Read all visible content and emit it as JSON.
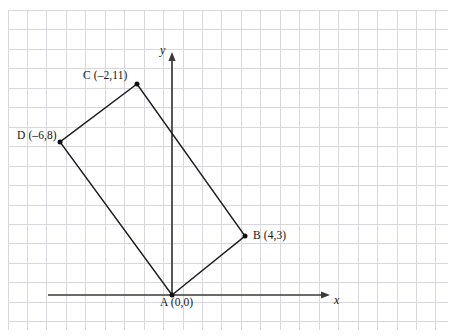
{
  "figure": {
    "kind": "coordinate-grid-diagram",
    "width": 452,
    "height": 336,
    "background_color": "#ffffff",
    "grid": {
      "minor_color": "#d8d8dc",
      "major_color": "#8f8f96",
      "spacing_px": 19.45,
      "origin_px": {
        "x": 172,
        "y": 295
      },
      "first_line_px": {
        "x": 8.0,
        "y": 10.5
      },
      "columns": 23,
      "rows": 17,
      "major_every": 0
    },
    "axes": {
      "color": "#3a3a3a",
      "x_axis": {
        "label": "x",
        "from_px": {
          "x": 48,
          "y": 295
        },
        "to_px": {
          "x": 330,
          "y": 295
        },
        "arrow": "right"
      },
      "y_axis": {
        "label": "y",
        "from_px": {
          "x": 172,
          "y": 295
        },
        "to_px": {
          "x": 172,
          "y": 52
        },
        "arrow": "up"
      }
    }
  },
  "chart_data": {
    "type": "scatter",
    "title": "",
    "xlabel": "x",
    "ylabel": "y",
    "grid": true,
    "legend": "none",
    "units_per_cell": 1,
    "shape": {
      "name": "rectangle-ABCD",
      "closed": true,
      "stroke_color": "#1b1b1b",
      "vertex_order": [
        "A",
        "B",
        "C",
        "D"
      ],
      "edges": [
        "A-B",
        "B-C",
        "C-D",
        "D-A"
      ]
    },
    "points": [
      {
        "id": "A",
        "label": "A (0,0)",
        "name": "A",
        "x": 0,
        "y": 0,
        "px": {
          "x": 172,
          "y": 295
        },
        "label_position": "below"
      },
      {
        "id": "B",
        "label": "B (4,3)",
        "name": "B",
        "x": 4,
        "y": 3,
        "px": {
          "x": 245,
          "y": 236
        },
        "label_position": "right"
      },
      {
        "id": "C",
        "label": "C (–2,11)",
        "name": "C",
        "x": -2,
        "y": 11,
        "px": {
          "x": 137,
          "y": 84
        },
        "label_position": "left"
      },
      {
        "id": "D",
        "label": "D (–6,8)",
        "name": "D",
        "x": -6,
        "y": 8,
        "px": {
          "x": 60,
          "y": 142
        },
        "label_position": "left"
      }
    ]
  },
  "labels": {
    "point_a": "A (0,0)",
    "point_b": "B (4,3)",
    "point_c": "C (–2,11)",
    "point_d": "D (–6,8)",
    "axis_x": "x",
    "axis_y": "y"
  }
}
